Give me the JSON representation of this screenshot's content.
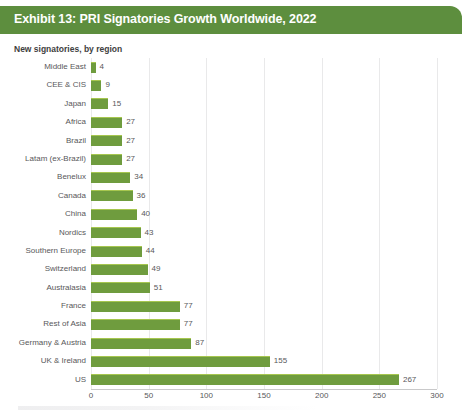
{
  "header": {
    "title": "Exhibit 13: PRI Signatories Growth Worldwide, 2022",
    "background_color": "#5d8e3e",
    "text_color": "#ffffff"
  },
  "subtitle": "New signatories, by region",
  "colors": {
    "bar": "#6f9c3e",
    "bar_highlight": "#a6c64f",
    "gridline": "#e9e9ea",
    "axis": "#c9c9ca",
    "label_text": "#58585a"
  },
  "chart_data": {
    "type": "bar",
    "orientation": "horizontal",
    "title": "Exhibit 13: PRI Signatories Growth Worldwide, 2022",
    "subtitle": "New signatories, by region",
    "xlabel": "",
    "ylabel": "",
    "xlim": [
      0,
      300
    ],
    "xticks": [
      "0",
      "50",
      "100",
      "150",
      "200",
      "250",
      "300"
    ],
    "xtick_values": [
      0,
      50,
      100,
      150,
      200,
      250,
      300
    ],
    "grid": "vertical",
    "legend": "none",
    "categories": [
      "Middle East",
      "CEE & CIS",
      "Japan",
      "Africa",
      "Brazil",
      "Latam (ex-Brazil)",
      "Benelux",
      "Canada",
      "China",
      "Nordics",
      "Southern Europe",
      "Switzerland",
      "Australasia",
      "France",
      "Rest of Asia",
      "Germany & Austria",
      "UK & Ireland",
      "US"
    ],
    "values": [
      4,
      9,
      15,
      27,
      27,
      27,
      34,
      36,
      40,
      43,
      44,
      49,
      51,
      77,
      77,
      87,
      155,
      267
    ],
    "data_labels": [
      "4",
      "9",
      "15",
      "27",
      "27",
      "27",
      "34",
      "36",
      "40",
      "43",
      "44",
      "49",
      "51",
      "77",
      "77",
      "87",
      "155",
      "267"
    ]
  }
}
